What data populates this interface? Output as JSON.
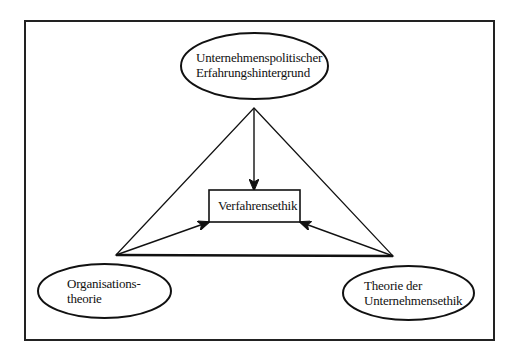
{
  "diagram": {
    "type": "triangle-relationship",
    "frame": {
      "x": 25,
      "y": 21,
      "width": 469,
      "height": 319
    },
    "center_box": {
      "label": "Verfahrensethik",
      "x": 209,
      "y": 190,
      "width": 91,
      "height": 32
    },
    "nodes": [
      {
        "id": "top",
        "lines": [
          "Unternehmenspolitischer",
          "Erfahrungshintergrund"
        ],
        "cx": 254.5,
        "cy": 66,
        "rx": 73.5,
        "ry": 33
      },
      {
        "id": "left",
        "lines": [
          "Organisations-",
          "theorie"
        ],
        "cx": 104.5,
        "cy": 291,
        "rx": 66.5,
        "ry": 27
      },
      {
        "id": "right",
        "lines": [
          "Theorie der",
          "Unternehmensethik"
        ],
        "cx": 408.5,
        "cy": 293,
        "rx": 65.5,
        "ry": 27
      }
    ],
    "triangle": {
      "apex": [
        254,
        108
      ],
      "bottom_left": [
        116,
        255
      ],
      "bottom_right": [
        393,
        256
      ]
    },
    "arrows": [
      {
        "from": "apex",
        "to": [
          254,
          190
        ],
        "target": "Verfahrensethik"
      },
      {
        "from": "bottom_left",
        "to": [
          209,
          222
        ],
        "target": "Verfahrensethik"
      },
      {
        "from": "bottom_right",
        "to": [
          300,
          222
        ],
        "target": "Verfahrensethik"
      }
    ],
    "colors": {
      "stroke": "#111111",
      "background": "#ffffff"
    }
  }
}
